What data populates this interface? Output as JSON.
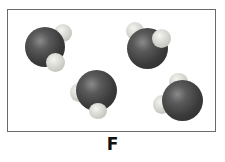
{
  "figure": {
    "label": "F",
    "molecule_count": 4
  },
  "molecules": [
    {
      "name": "water-molecule-1",
      "formula": "H2O"
    },
    {
      "name": "water-molecule-2",
      "formula": "H2O"
    },
    {
      "name": "water-molecule-3",
      "formula": "H2O"
    },
    {
      "name": "water-molecule-4",
      "formula": "H2O"
    }
  ],
  "colors": {
    "oxygen": "#3a3a3a",
    "hydrogen": "#d8d8d2",
    "frame": "#6a6a6a"
  }
}
